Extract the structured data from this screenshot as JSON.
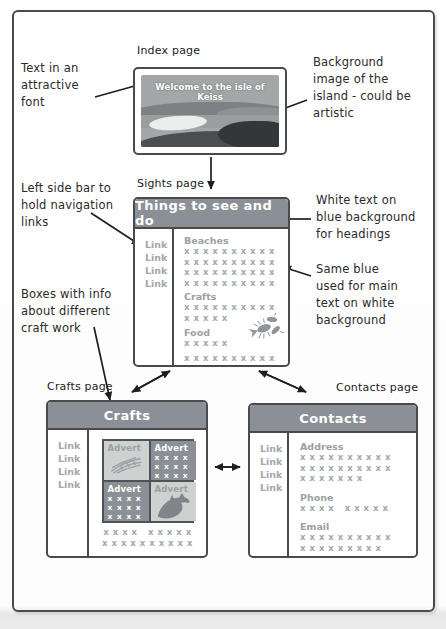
{
  "colors": {
    "header_bg": "#8a9095",
    "muted_text": "#a3a8ac",
    "section_text": "#9aa0a4",
    "annotation_text": "#2a2a2a",
    "box_border": "#4a4a4a",
    "advert_light_bg": "#cdd1cf"
  },
  "annotations": {
    "attractive_font": [
      "Text in an",
      "attractive",
      "font"
    ],
    "background_image": [
      "Background",
      "image of the",
      "island - could be",
      "artistic"
    ],
    "sidebar": [
      "Left side bar to",
      "hold navigation",
      "links"
    ],
    "white_text": [
      "White text on",
      "blue background",
      "for headings"
    ],
    "same_blue": [
      "Same blue",
      "used for main",
      "text on white",
      "background"
    ],
    "boxes_info": [
      "Boxes with info",
      "about different",
      "craft work"
    ]
  },
  "index_page": {
    "label": "Index page",
    "title": "Welcome to the isle of Keiss"
  },
  "sights_page": {
    "label": "Sights page",
    "header": "Things to see and do",
    "links": [
      "Link",
      "Link",
      "Link",
      "Link"
    ],
    "sections": [
      {
        "heading": "Beaches",
        "rows": [
          "x x x x x x x x x x",
          "x x x x x x x x x x",
          "x x x x x x x x x x",
          "x x x x x x x x x x"
        ]
      },
      {
        "heading": "Crafts",
        "rows": [
          "x x x x x x x x x x",
          "x x x x x"
        ]
      },
      {
        "heading": "Food",
        "rows": [
          "x x x x x"
        ]
      }
    ],
    "footer_row": "x x x x x x x x x x"
  },
  "crafts_page": {
    "label": "Crafts page",
    "header": "Crafts",
    "links": [
      "Link",
      "Link",
      "Link",
      "Link"
    ],
    "adverts": [
      {
        "label": "Advert",
        "variant": "light",
        "art": "sketch-icon"
      },
      {
        "label": "Advert",
        "variant": "dark",
        "rows": [
          "x x x x",
          "x x x x",
          "x x x x"
        ]
      },
      {
        "label": "Advert",
        "variant": "dark",
        "rows": [
          "x x x x",
          "x x x x",
          "x x x x"
        ]
      },
      {
        "label": "Advert",
        "variant": "light",
        "art": "dolphin-icon"
      }
    ],
    "footer_rows": [
      "x x x x   x x x x x",
      "x x x x x x x x x x"
    ]
  },
  "contacts_page": {
    "label": "Contacts page",
    "header": "Contacts",
    "links": [
      "Link",
      "Link",
      "Link",
      "Link"
    ],
    "sections": [
      {
        "heading": "Address",
        "rows": [
          "x x x x x x x x x x",
          "x x x x x x x x x x",
          "x x x x x x x"
        ]
      },
      {
        "heading": "Phone",
        "rows": [
          "x x x x   x x x x x"
        ]
      },
      {
        "heading": "Email",
        "rows": [
          "x x x x x x x x x x",
          "x x x x x x x x x"
        ]
      }
    ]
  }
}
